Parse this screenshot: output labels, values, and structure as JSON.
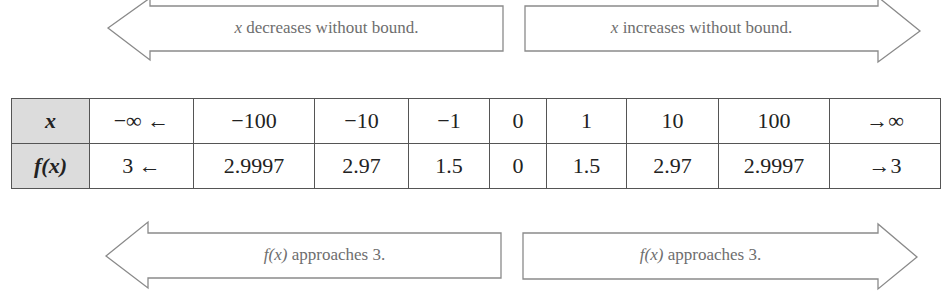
{
  "arrows": {
    "top_left": {
      "direction": "left",
      "var": "x",
      "text": " decreases without bound."
    },
    "top_right": {
      "direction": "right",
      "var": "x",
      "text": " increases without bound."
    },
    "bottom_left": {
      "direction": "left",
      "var": "f(x)",
      "text": " approaches 3."
    },
    "bottom_right": {
      "direction": "right",
      "var": "f(x)",
      "text": " approaches 3."
    }
  },
  "table": {
    "row_x": {
      "header": "x",
      "cells": [
        "−∞ ←",
        "−100",
        "−10",
        "−1",
        "0",
        "1",
        "10",
        "100",
        "→∞"
      ]
    },
    "row_fx": {
      "header": "f(x)",
      "cells": [
        "3 ←",
        "2.9997",
        "2.97",
        "1.5",
        "0",
        "1.5",
        "2.97",
        "2.9997",
        "→3"
      ]
    }
  },
  "colors": {
    "header_fill": "#dcdcdc",
    "arrow_stroke": "#8a8a8a",
    "label_text": "#6e6e6e",
    "table_border": "#555555"
  }
}
